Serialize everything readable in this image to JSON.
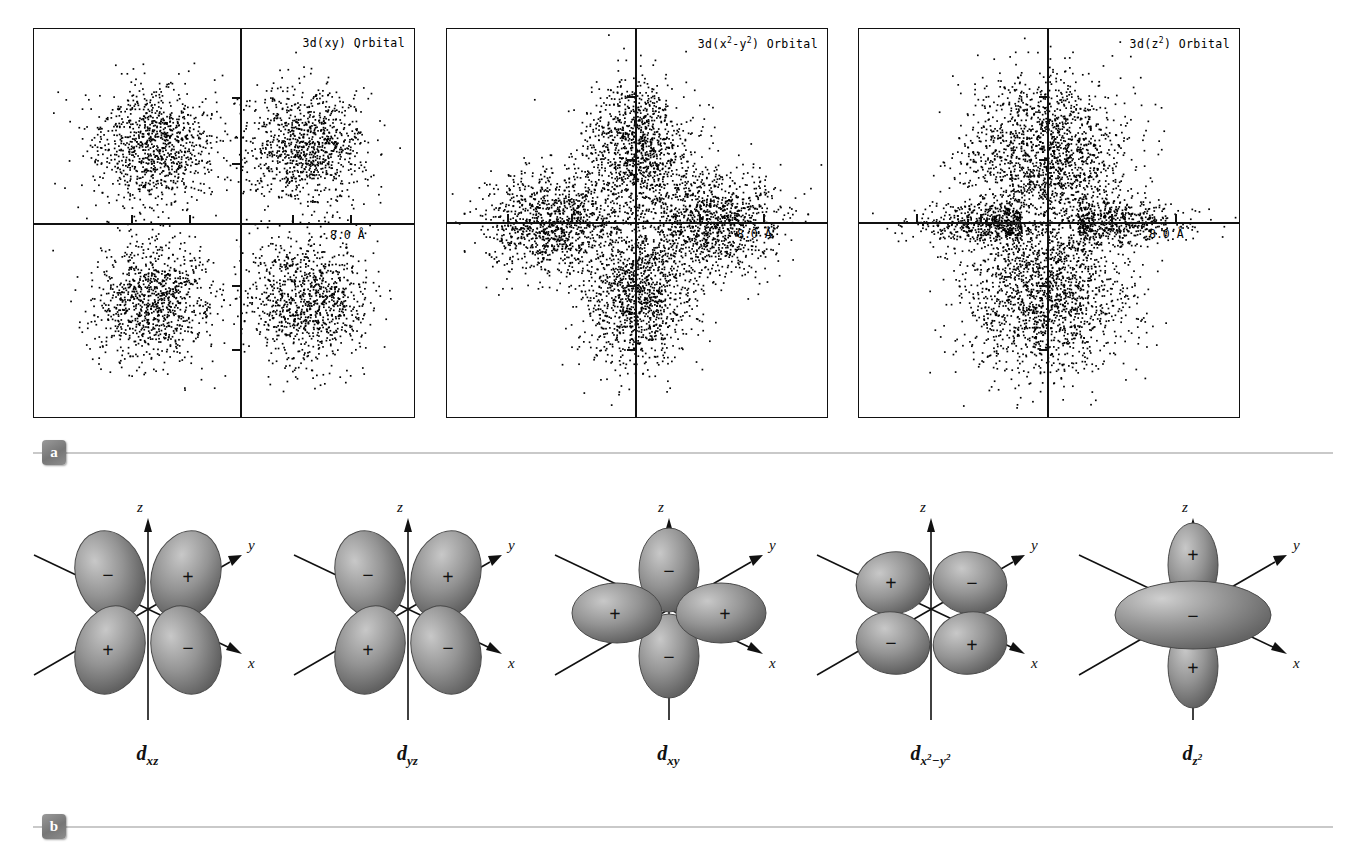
{
  "figure": {
    "panel_a_badge": "a",
    "panel_b_badge": "b"
  },
  "chart_data": {
    "type": "scatter",
    "scale_label": "8.0 Å",
    "panels": [
      {
        "id": "3d-xy",
        "title_text": "3d(xy) Orbital",
        "title_base": "3d(xy) Orbital",
        "lobe_arrangement": "four diagonal lobes between the axes",
        "lobe_count": 4,
        "lobe_centers": [
          [
            -0.46,
            0.4
          ],
          [
            0.34,
            0.4
          ],
          [
            -0.46,
            -0.4
          ],
          [
            0.34,
            -0.4
          ]
        ],
        "axis_origin": [
          0.545,
          0.5
        ],
        "scale_label": "8.0 Å",
        "approx_point_count": 4000
      },
      {
        "id": "3d-x2-y2",
        "title_text": "3d(x²-y²) Orbital",
        "title_base": "3d(x",
        "lobe_arrangement": "four lobes lying along the horizontal and vertical axes",
        "lobe_count": 4,
        "lobe_centers": [
          [
            0.0,
            0.38
          ],
          [
            0.0,
            -0.38
          ],
          [
            -0.44,
            0.0
          ],
          [
            0.4,
            0.0
          ]
        ],
        "axis_origin": [
          0.5,
          0.5
        ],
        "scale_label": "8.0 Å",
        "approx_point_count": 4500
      },
      {
        "id": "3d-z2",
        "title_text": "3d(z²) Orbital",
        "title_base": "3d(z",
        "lobe_arrangement": "two large vertical lobes plus a thin horizontal torus band",
        "lobe_count": 2,
        "lobe_centers": [
          [
            -0.02,
            0.34
          ],
          [
            -0.02,
            -0.36
          ]
        ],
        "axis_origin": [
          0.5,
          0.5
        ],
        "scale_label": "8.0 Å",
        "approx_point_count": 4500
      }
    ]
  },
  "orbitals": [
    {
      "id": "dxz",
      "label_d": "d",
      "label_sub": "xz",
      "style": "diagonal",
      "signs": {
        "top_left": "−",
        "top_right": "+",
        "bottom_left": "+",
        "bottom_right": "−"
      },
      "axes": {
        "z": "z",
        "y": "y",
        "x": "x"
      }
    },
    {
      "id": "dyz",
      "label_d": "d",
      "label_sub": "yz",
      "style": "diagonal",
      "signs": {
        "top_left": "−",
        "top_right": "+",
        "bottom_left": "+",
        "bottom_right": "−"
      },
      "axes": {
        "z": "z",
        "y": "y",
        "x": "x"
      }
    },
    {
      "id": "dxy",
      "label_d": "d",
      "label_sub": "xy",
      "style": "cross",
      "signs": {
        "left": "+",
        "right": "+",
        "top": "−",
        "bottom": "−"
      },
      "axes": {
        "z": "z",
        "y": "y",
        "x": "x"
      }
    },
    {
      "id": "dx2y2",
      "label_d": "d",
      "label_sub_x": "x",
      "label_sup_1": "2",
      "label_minus": "−",
      "label_sub_y": "y",
      "label_sup_2": "2",
      "style": "diagonal",
      "signs": {
        "top_left": "+",
        "top_right": "−",
        "bottom_left": "−",
        "bottom_right": "+"
      },
      "axes": {
        "z": "z",
        "y": "y",
        "x": "x"
      }
    },
    {
      "id": "dz2",
      "label_d": "d",
      "label_sub_z": "z",
      "label_sup": "2",
      "style": "dz2",
      "signs": {
        "top": "+",
        "bottom": "+",
        "torus": "−"
      },
      "axes": {
        "z": "z",
        "y": "y",
        "x": "x"
      }
    }
  ],
  "colors": {
    "lobe_fill": "#8d8d8d",
    "lobe_highlight": "#c4c4c4",
    "lobe_shadow": "#5e5e5e",
    "axis_line": "#111111",
    "rule": "#c9c9c9",
    "badge": "#7d7d7d"
  }
}
